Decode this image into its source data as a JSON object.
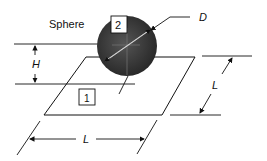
{
  "diagram": {
    "labels": {
      "sphere": "Sphere",
      "surface_2": "2",
      "surface_1": "1",
      "diameter": "D",
      "height": "H",
      "side_right": "L",
      "side_bottom": "L"
    },
    "colors": {
      "line": "#111111",
      "sphere_dark": "#2a2a2a",
      "sphere_mid": "#4a4a4a",
      "background": "#ffffff"
    }
  }
}
